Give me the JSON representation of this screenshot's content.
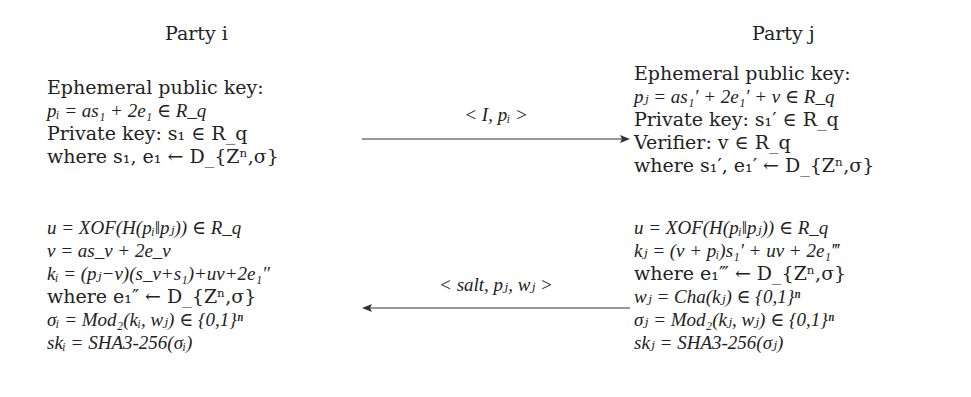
{
  "party_i": {
    "title": "Party i",
    "block1": [
      "Ephemeral public key:",
      "pᵢ = as₁ + 2e₁ ∈ R_q",
      "Private key: s₁ ∈ R_q",
      "where s₁, e₁ ← D_{Zⁿ,σ}"
    ],
    "block2": [
      "u = XOF(H(pᵢ‖pⱼ)) ∈ R_q",
      "v = as_v + 2e_v",
      "kᵢ = (pⱼ−v)(s_v+s₁)+uv+2e₁″",
      "where e₁″ ← D_{Zⁿ,σ}",
      "σᵢ = Mod₂(kᵢ, wⱼ) ∈ {0,1}ⁿ",
      "skᵢ = SHA3-256(σᵢ)"
    ]
  },
  "party_j": {
    "title": "Party j",
    "block1": [
      "Ephemeral public key:",
      "pⱼ = as₁′ + 2e₁′ + v ∈ R_q",
      "Private key: s₁′ ∈ R_q",
      "Verifier: v ∈ R_q",
      "where s₁′, e₁′ ← D_{Zⁿ,σ}"
    ],
    "block2": [
      "u = XOF(H(pᵢ‖pⱼ)) ∈ R_q",
      "kⱼ = (v + pᵢ)s₁′ + uv + 2e₁‴",
      "where e₁‴ ← D_{Zⁿ,σ}",
      "wⱼ = Cha(kⱼ) ∈ {0,1}ⁿ",
      "σⱼ = Mod₂(kⱼ, wⱼ) ∈ {0,1}ⁿ",
      "skⱼ = SHA3-256(σⱼ)"
    ]
  },
  "messages": [
    {
      "label": "< I, pᵢ >",
      "direction": "i_to_j"
    },
    {
      "label": "< salt, pⱼ, wⱼ >",
      "direction": "j_to_i"
    }
  ]
}
